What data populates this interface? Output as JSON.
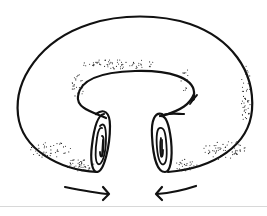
{
  "figure": {
    "elements": [
      "outer-torus-outline",
      "inner-hole-outline",
      "left-cut-end-spiral",
      "right-cut-end-spiral",
      "left-arrow-pointing-right",
      "right-arrow-pointing-left",
      "stipple-shading"
    ],
    "colors": {
      "line": "#111111",
      "background": "#ffffff",
      "rule": "#d8d8d8"
    }
  }
}
